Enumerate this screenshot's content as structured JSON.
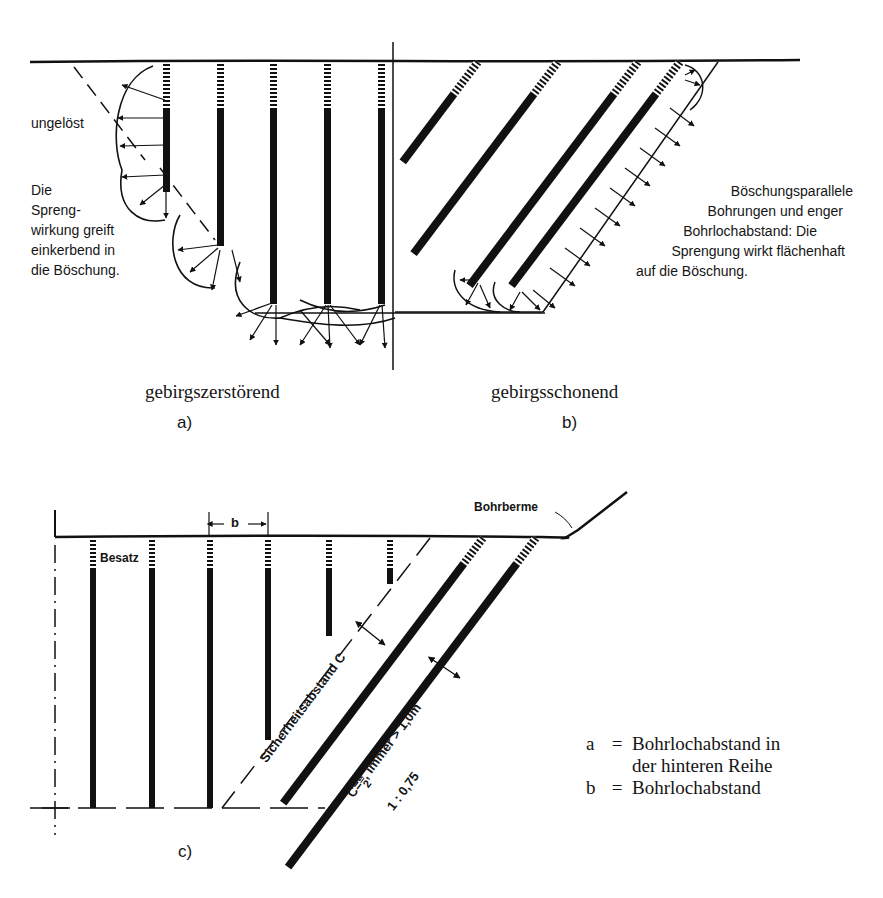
{
  "panel_a": {
    "label_unloosened": "ungelöst",
    "description_lines": [
      "Die",
      "Spreng-",
      "wirkung greift",
      "einkerbend in",
      "die Böschung."
    ],
    "title": "gebirgszerstörend",
    "caption": "a)"
  },
  "panel_b": {
    "description_lines": [
      "Böschungsparallele",
      "Bohrungen und enger",
      "Bohrlochabstand: Die",
      "Sprengung wirkt flächenhaft",
      "auf die Böschung."
    ],
    "title": "gebirgsschonend",
    "caption": "b)"
  },
  "panel_c": {
    "spacing_label": "b",
    "stemming_label": "Besatz",
    "berm_label": "Bohrberme",
    "safety_distance_label": "Sicherheitsabstand  C",
    "formula_prefix": "C=",
    "formula_num": "a",
    "formula_den": "2",
    "formula_suffix": ",  immer > 1,0m",
    "slope_ratio": "1 : 0,75",
    "caption": "c)"
  },
  "legend": [
    {
      "key": "a",
      "eq": "=",
      "lines": [
        "Bohrlochabstand in",
        "der hinteren Reihe"
      ]
    },
    {
      "key": "b",
      "eq": "=",
      "lines": [
        "Bohrlochabstand"
      ]
    }
  ],
  "colors": {
    "ink": "#111111",
    "paper": "#ffffff"
  }
}
